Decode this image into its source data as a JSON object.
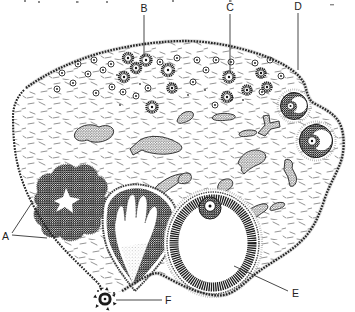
{
  "figure_labels": {
    "a": "A",
    "b": "B",
    "c": "C",
    "d": "D",
    "e": "E",
    "f": "F"
  },
  "colors": {
    "ink": "#1a1a1a",
    "paper": "#ffffff",
    "leader_line": "#333333",
    "fuzz": "#999999"
  }
}
